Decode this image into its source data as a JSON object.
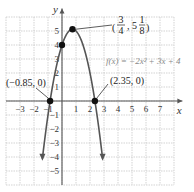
{
  "chart_data": {
    "type": "line",
    "title": "",
    "xlabel": "x",
    "ylabel": "y",
    "xlim": [
      -4,
      8
    ],
    "ylim": [
      -6,
      6
    ],
    "grid": true,
    "x_ticks": [
      "-3",
      "-2",
      "-1",
      "1",
      "2",
      "3",
      "4",
      "5",
      "6",
      "7"
    ],
    "y_ticks": [
      "5",
      "4",
      "3",
      "2",
      "1",
      "-1",
      "-2",
      "-3",
      "-4",
      "-5"
    ],
    "function_label": "f(x) = −2x² + 3x + 4",
    "series": [
      {
        "name": "f(x) = -2x^2 + 3x + 4",
        "equation": "-2x^2+3x+4",
        "x_range": [
          -1.4,
          2.9
        ]
      }
    ],
    "points": [
      {
        "label": "(3/4, 5 1/8)",
        "x": 0.75,
        "y": 5.125
      },
      {
        "label": "(0, 4)",
        "x": 0,
        "y": 4
      },
      {
        "label": "(−0.85, 0)",
        "x": -0.85,
        "y": 0
      },
      {
        "label": "(2.35, 0)",
        "x": 2.35,
        "y": 0
      }
    ],
    "annotations": {
      "vertex": {
        "num": "3",
        "den": "4",
        "whole": "5",
        "fnum": "1",
        "fden": "8"
      },
      "left_root": "(−0.85, 0)",
      "right_root": "(2.35, 0)"
    }
  }
}
